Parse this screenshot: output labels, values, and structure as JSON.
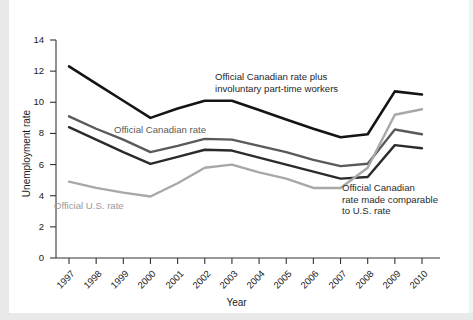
{
  "chart_data": {
    "type": "line",
    "title": "",
    "xlabel": "Year",
    "ylabel": "Unemployment rate",
    "x": [
      1997,
      1998,
      1999,
      2000,
      2001,
      2002,
      2003,
      2004,
      2005,
      2006,
      2007,
      2008,
      2009,
      2010
    ],
    "xticklabels": [
      "1997",
      "1998",
      "1999",
      "2000",
      "2001",
      "2002",
      "2003",
      "2004",
      "2005",
      "2006",
      "2007",
      "2008",
      "2009",
      "2010"
    ],
    "yticklabels": [
      "0",
      "2",
      "4",
      "6",
      "8",
      "10",
      "12",
      "14"
    ],
    "ytickvalues": [
      0,
      2,
      4,
      6,
      8,
      10,
      12,
      14
    ],
    "ylim": [
      0,
      14
    ],
    "xlim": [
      1997,
      2010
    ],
    "grid": false,
    "legend_position": "inline-annotations",
    "series": [
      {
        "name": "Official Canadian rate plus involuntary part-time workers",
        "color": "#141414",
        "width": 2.6,
        "values": [
          12.3,
          11.2,
          10.1,
          9.0,
          9.6,
          10.1,
          10.1,
          9.5,
          8.9,
          8.3,
          7.75,
          7.95,
          10.7,
          10.5
        ]
      },
      {
        "name": "Official Canadian rate",
        "color": "#5a5a5a",
        "width": 2.4,
        "values": [
          9.1,
          8.3,
          7.6,
          6.8,
          7.2,
          7.65,
          7.6,
          7.2,
          6.8,
          6.3,
          5.9,
          6.05,
          8.25,
          7.95
        ]
      },
      {
        "name": "Official Canadian rate made comparable to U.S. rate",
        "color": "#2b2b2b",
        "width": 2.4,
        "values": [
          8.4,
          7.6,
          6.8,
          6.05,
          6.5,
          6.95,
          6.9,
          6.45,
          6.0,
          5.55,
          5.1,
          5.2,
          7.25,
          7.05
        ]
      },
      {
        "name": "Official U.S. rate",
        "color": "#a8a8a8",
        "width": 2.4,
        "values": [
          4.9,
          4.5,
          4.2,
          3.95,
          4.8,
          5.8,
          6.0,
          5.5,
          5.1,
          4.5,
          4.5,
          5.8,
          9.2,
          9.55
        ]
      }
    ],
    "annotations": [
      {
        "id": "annot-black",
        "text": "Official Canadian rate plus\ninvoluntary part-time workers",
        "color": "#1f1f1f",
        "x": 215,
        "y": 71
      },
      {
        "id": "annot-canadian",
        "text": "Official Canadian rate",
        "color": "#5a5a5a",
        "x": 114,
        "y": 124
      },
      {
        "id": "annot-us",
        "text": "Official U.S. rate",
        "color": "#9a9a9a",
        "x": 54,
        "y": 200
      },
      {
        "id": "annot-comparable",
        "text": "Official Canadian\nrate made comparable\nto U.S. rate",
        "color": "#2b2b2b",
        "x": 342,
        "y": 182
      }
    ]
  }
}
